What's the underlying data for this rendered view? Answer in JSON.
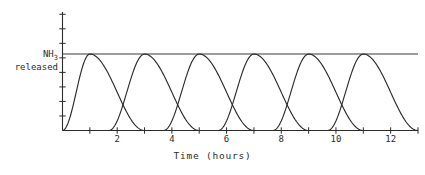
{
  "chart_data": {
    "type": "line",
    "title": "",
    "xlabel": "Time (hours)",
    "ylabel_line1": "NH",
    "ylabel_sub": "3",
    "ylabel_line2": "released",
    "xlim": [
      0,
      13
    ],
    "ylim": [
      0,
      1.55
    ],
    "grid": false,
    "legend": "none",
    "x_tick_interval": 1,
    "x_tick_values": [
      0,
      1,
      2,
      3,
      4,
      5,
      6,
      7,
      8,
      9,
      10,
      11,
      12,
      13
    ],
    "x_tick_labels": [
      {
        "value": 2,
        "label": "2"
      },
      {
        "value": 4,
        "label": "4"
      },
      {
        "value": 6,
        "label": "6"
      },
      {
        "value": 8,
        "label": "8"
      },
      {
        "value": 10,
        "label": "10"
      },
      {
        "value": 12,
        "label": "12"
      }
    ],
    "y_tick_count": 8,
    "y_tick_values": [
      0.19,
      0.38,
      0.57,
      0.76,
      0.95,
      1.14,
      1.33,
      1.52
    ],
    "y_tick_labels": [],
    "threshold_line": {
      "name": "peak-level",
      "y": 1.0,
      "x_start": 0,
      "x_end": 13,
      "label": ""
    },
    "series": [
      {
        "name": "pulse-1",
        "peak_x": 1,
        "peak_y": 1.0,
        "rise_start": 0.0,
        "fall_end": 3.0
      },
      {
        "name": "pulse-2",
        "peak_x": 3,
        "peak_y": 1.0,
        "rise_start": 1.7,
        "fall_end": 5.0
      },
      {
        "name": "pulse-3",
        "peak_x": 5,
        "peak_y": 1.0,
        "rise_start": 3.7,
        "fall_end": 7.0
      },
      {
        "name": "pulse-4",
        "peak_x": 7,
        "peak_y": 1.0,
        "rise_start": 5.7,
        "fall_end": 9.0
      },
      {
        "name": "pulse-5",
        "peak_x": 9,
        "peak_y": 1.0,
        "rise_start": 7.7,
        "fall_end": 11.0
      },
      {
        "name": "pulse-6",
        "peak_x": 11,
        "peak_y": 1.0,
        "rise_start": 9.7,
        "fall_end": 13.0
      }
    ],
    "colors": {
      "axis": "#2b2b2b",
      "curve": "#2b2b2b",
      "threshold": "#3a3a3a",
      "background": "#ffffff",
      "text": "#2b2b2b"
    }
  }
}
